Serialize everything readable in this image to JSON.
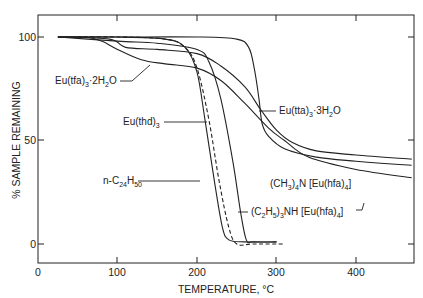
{
  "chart_data": {
    "type": "line",
    "title": "",
    "xlabel": "TEMPERATURE, °C",
    "ylabel": "% SAMPLE REMAINING",
    "xlim": [
      0,
      475
    ],
    "ylim": [
      -10,
      110
    ],
    "xticks": [
      0,
      100,
      200,
      300,
      400
    ],
    "yticks": [
      0,
      50,
      100
    ],
    "grid": false,
    "legend": "inline labels",
    "series": [
      {
        "name": "(CH3)4N[Eu(hfa)4]",
        "style": "solid",
        "x": [
          25,
          100,
          200,
          250,
          265,
          272,
          278,
          282,
          290,
          310,
          350,
          400,
          470
        ],
        "y": [
          100,
          100,
          100,
          99,
          95,
          85,
          70,
          58,
          52,
          46,
          42,
          40,
          38
        ]
      },
      {
        "name": "Eu(tta)3·3H2O",
        "style": "solid",
        "x": [
          25,
          90,
          110,
          150,
          200,
          230,
          260,
          280,
          300,
          320,
          350,
          400,
          470
        ],
        "y": [
          100,
          99,
          95,
          94,
          92,
          86,
          76,
          65,
          55,
          49,
          45,
          43,
          41
        ]
      },
      {
        "name": "Eu(tfa)3·2H2O",
        "style": "solid",
        "x": [
          25,
          60,
          80,
          100,
          130,
          160,
          200,
          230,
          260,
          290,
          310,
          340,
          400,
          470
        ],
        "y": [
          100,
          100,
          98,
          94,
          89,
          87,
          85,
          79,
          68,
          56,
          50,
          42,
          36,
          32
        ]
      },
      {
        "name": "Eu(thd)3",
        "style": "solid",
        "x": [
          25,
          100,
          150,
          200,
          215,
          230,
          245,
          255,
          262,
          270,
          300
        ],
        "y": [
          100,
          98,
          97,
          94,
          88,
          70,
          40,
          15,
          2,
          1,
          1
        ]
      },
      {
        "name": "n-C24H50",
        "style": "dashed",
        "x": [
          25,
          100,
          160,
          185,
          200,
          215,
          228,
          240,
          250,
          270,
          310
        ],
        "y": [
          100,
          100,
          99,
          95,
          85,
          60,
          30,
          8,
          0,
          0,
          0
        ]
      },
      {
        "name": "(C2H5)3NH[Eu(hfa)4]",
        "style": "solid",
        "x": [
          25,
          100,
          160,
          185,
          200,
          210,
          222,
          232,
          240,
          260,
          300
        ],
        "y": [
          100,
          100,
          99,
          95,
          83,
          60,
          30,
          8,
          2,
          1,
          1
        ]
      }
    ],
    "annotations": [
      "Eu(tfa)3·2H2O",
      "Eu(thd)3",
      "n-C24H50",
      "Eu(tta)3·3H2O",
      "(CH3)4N[Eu(hfa)4]",
      "(C2H5)3NH[Eu(hfa)4]"
    ]
  },
  "axes": {
    "xlabel": "TEMPERATURE, °C",
    "ylabel": "% SAMPLE REMAINING",
    "xtick_labels": [
      "0",
      "100",
      "200",
      "300",
      "400"
    ],
    "ytick_labels": [
      "0",
      "50",
      "100"
    ]
  },
  "labels": {
    "tfa_main": "Eu(tfa)",
    "tfa_sub": "3",
    "tfa_rest": "·2H",
    "tfa_sub2": "2",
    "tfa_end": "O",
    "thd_main": "Eu(thd)",
    "thd_sub": "3",
    "c24_main": "n-C",
    "c24_sub": "24",
    "c24_h": "H",
    "c24_sub2": "50",
    "tta_main": "Eu(tta)",
    "tta_sub": "3",
    "tta_rest": "·3H",
    "tta_sub2": "2",
    "tta_end": "O",
    "me4n_a": "(CH",
    "me4n_sub1": "3",
    "me4n_b": ")",
    "me4n_sub2": "4",
    "me4n_c": "N [Eu(hfa)",
    "me4n_sub3": "4",
    "me4n_d": "]",
    "et3nh_a": "(C",
    "et3nh_sub1": "2",
    "et3nh_b": "H",
    "et3nh_sub2": "5",
    "et3nh_c": ")",
    "et3nh_sub3": "3",
    "et3nh_d": "NH [Eu(hfa)",
    "et3nh_sub4": "4",
    "et3nh_e": "]"
  }
}
